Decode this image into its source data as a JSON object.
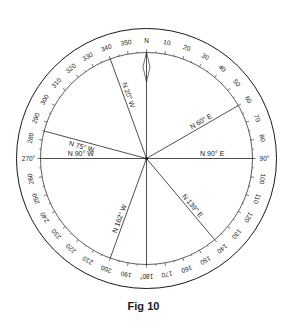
{
  "figure": {
    "caption": "Fig 10",
    "center": {
      "x": 146.5,
      "y": 158.5
    },
    "outer_radius": 130,
    "inner_radius": 106,
    "line_color": "#1a1a1a"
  },
  "ring_labels": [
    {
      "deg": 0,
      "text": "N"
    },
    {
      "deg": 10,
      "text": "10"
    },
    {
      "deg": 20,
      "text": "20"
    },
    {
      "deg": 30,
      "text": "30"
    },
    {
      "deg": 40,
      "text": "40"
    },
    {
      "deg": 50,
      "text": "50"
    },
    {
      "deg": 60,
      "text": "60"
    },
    {
      "deg": 70,
      "text": "70"
    },
    {
      "deg": 80,
      "text": "80"
    },
    {
      "deg": 90,
      "text": "90°"
    },
    {
      "deg": 100,
      "text": "100"
    },
    {
      "deg": 110,
      "text": "110"
    },
    {
      "deg": 120,
      "text": "120"
    },
    {
      "deg": 130,
      "text": "130"
    },
    {
      "deg": 140,
      "text": "140"
    },
    {
      "deg": 150,
      "text": "150"
    },
    {
      "deg": 160,
      "text": "160"
    },
    {
      "deg": 170,
      "text": "170"
    },
    {
      "deg": 180,
      "text": "180°"
    },
    {
      "deg": 190,
      "text": "190"
    },
    {
      "deg": 200,
      "text": "200"
    },
    {
      "deg": 210,
      "text": "210"
    },
    {
      "deg": 220,
      "text": "220"
    },
    {
      "deg": 230,
      "text": "230"
    },
    {
      "deg": 240,
      "text": "240"
    },
    {
      "deg": 250,
      "text": "250"
    },
    {
      "deg": 260,
      "text": "260"
    },
    {
      "deg": 270,
      "text": "270°"
    },
    {
      "deg": 280,
      "text": "280"
    },
    {
      "deg": 290,
      "text": "290"
    },
    {
      "deg": 300,
      "text": "300"
    },
    {
      "deg": 310,
      "text": "310"
    },
    {
      "deg": 320,
      "text": "320"
    },
    {
      "deg": 330,
      "text": "330"
    },
    {
      "deg": 340,
      "text": "340"
    },
    {
      "deg": 350,
      "text": "350"
    }
  ],
  "bearing_lines": [
    {
      "deg": 0,
      "label": ""
    },
    {
      "deg": 340,
      "label": "N 20° W"
    },
    {
      "deg": 60,
      "label": "N 60° E"
    },
    {
      "deg": 285,
      "label": "N 75° W"
    },
    {
      "deg": 270,
      "label": "N 90° W"
    },
    {
      "deg": 90,
      "label": "N 90° E"
    },
    {
      "deg": 140,
      "label": "N 139° E"
    },
    {
      "deg": 200,
      "label": "N 162° W"
    },
    {
      "deg": 180,
      "label": ""
    }
  ]
}
